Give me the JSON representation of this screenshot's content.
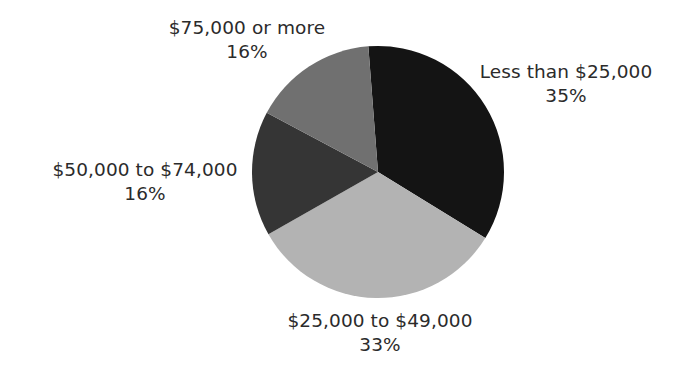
{
  "chart_data": {
    "type": "pie",
    "title": "",
    "categories": [
      "Less than $25,000",
      "$25,000 to $49,000",
      "$50,000 to $74,000",
      "$75,000 or more"
    ],
    "values": [
      35,
      33,
      16,
      16
    ],
    "value_labels": [
      "35%",
      "33%",
      "16%",
      "16%"
    ],
    "colors": [
      "#141414",
      "#b3b3b3",
      "#353535",
      "#707070"
    ],
    "start_angle_deg": -4.4,
    "direction": "clockwise",
    "legend": "none (direct labels)",
    "center": [
      378,
      172
    ],
    "radius": 126
  },
  "labels": [
    {
      "category": "Less than $25,000",
      "percent": "35%",
      "x": 566,
      "y": 60
    },
    {
      "category": "$25,000 to $49,000",
      "percent": "33%",
      "x": 380,
      "y": 309
    },
    {
      "category": "$50,000 to $74,000",
      "percent": "16%",
      "x": 145,
      "y": 158
    },
    {
      "category": "$75,000 or more",
      "percent": "16%",
      "x": 247,
      "y": 16
    }
  ]
}
